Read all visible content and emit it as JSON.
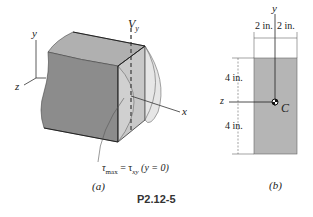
{
  "figure_a": {
    "axis_y": "y",
    "axis_z": "z",
    "axis_x": "x",
    "force_label": "V",
    "force_sub": "y",
    "stress_label": "τ",
    "stress_sub1": "max",
    "stress_eq": " = τ",
    "stress_sub2": "xy",
    "stress_cond": " (y = 0)",
    "sublabel": "(a)"
  },
  "figure_b": {
    "axis_y": "y",
    "axis_z": "z",
    "centroid": "C",
    "dim_left_width": "2 in.",
    "dim_right_width": "2 in.",
    "dim_top_height": "4 in.",
    "dim_bottom_height": "4 in.",
    "sublabel": "(b)"
  },
  "caption": "P2.12-5",
  "colors": {
    "body_front": "#8a8a8a",
    "body_top": "#a9a9a9",
    "section_face": "#c4c4c4",
    "cross_section": "#b5b5b5"
  }
}
